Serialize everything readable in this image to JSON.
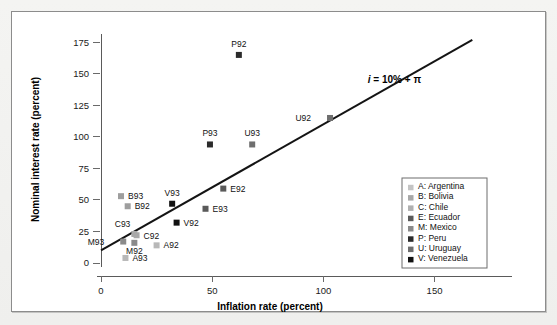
{
  "chart_data": {
    "type": "scatter",
    "title": "",
    "xlabel": "Inflation rate (percent)",
    "ylabel": "Nominal interest rate (percent)",
    "xlim": [
      0,
      170
    ],
    "ylim": [
      0,
      180
    ],
    "xticks": [
      0,
      50,
      100,
      150
    ],
    "yticks": [
      0,
      25,
      50,
      75,
      100,
      125,
      150,
      175
    ],
    "grid": false,
    "legend_position": "right-inside",
    "annotation": {
      "text": "i = 10% + π",
      "parts": {
        "i": "i",
        "rest": " = 10% + π"
      },
      "x": 120,
      "y": 143
    },
    "reference_line": {
      "label": "i = 10% + π",
      "intercept": 10,
      "slope": 1,
      "x_start": 0,
      "x_end": 167,
      "y_start": 10,
      "y_end": 177
    },
    "points": [
      {
        "label": "A92",
        "country": "Argentina",
        "x": 25,
        "y": 14,
        "color": "#b8b8b8",
        "label_dx": 7,
        "label_dy": 3
      },
      {
        "label": "A93",
        "country": "Argentina",
        "x": 11,
        "y": 4,
        "color": "#b8b8b8",
        "label_dx": 7,
        "label_dy": 3
      },
      {
        "label": "B92",
        "country": "Bolivia",
        "x": 12,
        "y": 45,
        "color": "#9e9e9e",
        "label_dx": 7,
        "label_dy": 3
      },
      {
        "label": "B93",
        "country": "Bolivia",
        "x": 9,
        "y": 53,
        "color": "#9e9e9e",
        "label_dx": 7,
        "label_dy": 3
      },
      {
        "label": "C92",
        "country": "Chile",
        "x": 16,
        "y": 22,
        "color": "#a8a8a8",
        "label_dx": 7,
        "label_dy": 4
      },
      {
        "label": "C93",
        "country": "Chile",
        "x": 15,
        "y": 23,
        "color": "#a8a8a8",
        "label_dx": -4,
        "label_dy": -7
      },
      {
        "label": "E92",
        "country": "Ecuador",
        "x": 55,
        "y": 59,
        "color": "#5a5a5a",
        "label_dx": 7,
        "label_dy": 3
      },
      {
        "label": "E93",
        "country": "Ecuador",
        "x": 47,
        "y": 43,
        "color": "#5a5a5a",
        "label_dx": 7,
        "label_dy": 3
      },
      {
        "label": "M92",
        "country": "Mexico",
        "x": 15,
        "y": 16,
        "color": "#8a8a8a",
        "label_dx": 0,
        "label_dy": 11
      },
      {
        "label": "M93",
        "country": "Mexico",
        "x": 10,
        "y": 17,
        "color": "#8a8a8a",
        "label_dx": -19,
        "label_dy": 3
      },
      {
        "label": "P92",
        "country": "Peru",
        "x": 62,
        "y": 165,
        "color": "#2b2b2b",
        "label_dx": 0,
        "label_dy": -8
      },
      {
        "label": "P93",
        "country": "Peru",
        "x": 49,
        "y": 94,
        "color": "#2b2b2b",
        "label_dx": 0,
        "label_dy": -8
      },
      {
        "label": "U92",
        "country": "Uruguay",
        "x": 103,
        "y": 115,
        "color": "#6e6e6e",
        "label_dx": -19,
        "label_dy": 3
      },
      {
        "label": "U93",
        "country": "Uruguay",
        "x": 68,
        "y": 94,
        "color": "#6e6e6e",
        "label_dx": 0,
        "label_dy": -8
      },
      {
        "label": "V92",
        "country": "Venezuela",
        "x": 34,
        "y": 32,
        "color": "#111111",
        "label_dx": 7,
        "label_dy": 3
      },
      {
        "label": "V93",
        "country": "Venezuela",
        "x": 32,
        "y": 47,
        "color": "#111111",
        "label_dx": 0,
        "label_dy": -8
      }
    ],
    "legend": {
      "entries": [
        {
          "code": "A",
          "name": "Argentina",
          "text": "A: Argentina",
          "color": "#c4c4c4"
        },
        {
          "code": "B",
          "name": "Bolivia",
          "text": "B: Bolivia",
          "color": "#a8a8a8"
        },
        {
          "code": "C",
          "name": "Chile",
          "text": "C: Chile",
          "color": "#b0b0b0"
        },
        {
          "code": "E",
          "name": "Ecuador",
          "text": "E: Ecuador",
          "color": "#5a5a5a"
        },
        {
          "code": "M",
          "name": "Mexico",
          "text": "M: Mexico",
          "color": "#8a8a8a"
        },
        {
          "code": "P",
          "name": "Peru",
          "text": "P: Peru",
          "color": "#2b2b2b"
        },
        {
          "code": "U",
          "name": "Uruguay",
          "text": "U: Uruguay",
          "color": "#6e6e6e"
        },
        {
          "code": "V",
          "name": "Venezuela",
          "text": "V: Venezuela",
          "color": "#111111"
        }
      ]
    }
  },
  "colors": {
    "frame_border": "#8c8c8c",
    "axis": "#5a5a5a",
    "line": "#141414",
    "background": "#ffffff",
    "page": "#f2f2f0"
  }
}
